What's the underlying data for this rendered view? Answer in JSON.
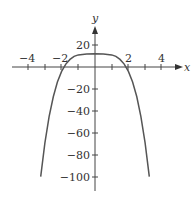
{
  "chart_data": {
    "type": "line",
    "title": "",
    "xlabel": "x",
    "ylabel": "y",
    "xlim": [
      -4.5,
      5.2
    ],
    "ylim": [
      -112,
      30
    ],
    "x_ticks": [
      -4,
      -3,
      -2,
      -1,
      1,
      2,
      3,
      4
    ],
    "x_tick_labels": [
      "-4",
      "-2",
      "2",
      "4"
    ],
    "y_ticks": [
      20,
      -20,
      -40,
      -60,
      -80,
      -100
    ],
    "y_tick_labels": [
      "20",
      "-20",
      "-40",
      "-60",
      "-80",
      "-100"
    ],
    "grid": false,
    "legend": null,
    "series": [
      {
        "name": "f(x)",
        "x": [
          -3.25,
          -3.0,
          -2.75,
          -2.5,
          -2.25,
          -2.0,
          -1.75,
          -1.5,
          -1.25,
          -1.0,
          -0.5,
          0,
          0.5,
          1.0,
          1.25,
          1.5,
          1.75,
          2.0,
          2.25,
          2.5,
          2.75,
          3.0,
          3.25
        ],
        "y": [
          -99.6,
          -69,
          -45.2,
          -27.1,
          -13.6,
          -4,
          2.6,
          6.9,
          9.6,
          11,
          11.9,
          12,
          11.9,
          11,
          9.6,
          6.9,
          2.6,
          -4,
          -13.6,
          -27.1,
          -45.2,
          -69,
          -99.6
        ]
      }
    ]
  },
  "labels": {
    "x_axis": "x",
    "y_axis": "y",
    "xt_m4": "−4",
    "xt_m2": "−2",
    "xt_2": "2",
    "xt_4": "4",
    "yt_20": "20",
    "yt_m20": "−20",
    "yt_m40": "−40",
    "yt_m60": "−60",
    "yt_m80": "−80",
    "yt_m100": "−100"
  }
}
